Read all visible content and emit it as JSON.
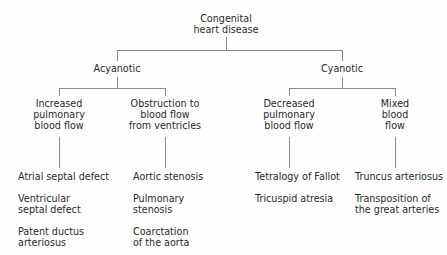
{
  "diagram": {
    "type": "tree",
    "root": {
      "label_line1": "Congenital",
      "label_line2": "heart disease"
    },
    "branches": [
      {
        "label": "Acyanotic",
        "groups": [
          {
            "label_lines": [
              "Increased",
              "pulmonary",
              "blood flow"
            ],
            "items": [
              {
                "lines": [
                  "Atrial septal defect"
                ]
              },
              {
                "lines": [
                  "Ventricular",
                  "septal defect"
                ]
              },
              {
                "lines": [
                  "Patent ductus",
                  "arteriosus"
                ]
              }
            ]
          },
          {
            "label_lines": [
              "Obstruction to",
              "blood flow",
              "from ventricles"
            ],
            "items": [
              {
                "lines": [
                  "Aortic stenosis"
                ]
              },
              {
                "lines": [
                  "Pulmonary",
                  "stenosis"
                ]
              },
              {
                "lines": [
                  "Coarctation",
                  "of the aorta"
                ]
              }
            ]
          }
        ]
      },
      {
        "label": "Cyanotic",
        "groups": [
          {
            "label_lines": [
              "Decreased",
              "pulmonary",
              "blood flow"
            ],
            "items": [
              {
                "lines": [
                  "Tetralogy of Fallot"
                ]
              },
              {
                "lines": [
                  "Tricuspid atresia"
                ]
              }
            ]
          },
          {
            "label_lines": [
              "Mixed",
              "blood",
              "flow"
            ],
            "items": [
              {
                "lines": [
                  "Truncus arteriosus"
                ]
              },
              {
                "lines": [
                  "Transposition of",
                  "the great arteries"
                ]
              }
            ]
          }
        ]
      }
    ]
  },
  "colors": {
    "text": "#2a2a2a",
    "lines": "#8a8a8a",
    "background": "#fefefe"
  }
}
